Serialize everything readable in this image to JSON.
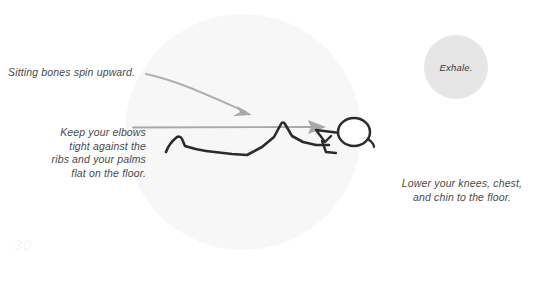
{
  "page": {
    "number": "30",
    "background_color": "#ffffff"
  },
  "pose_area": {
    "name": "pose-background-circle",
    "fill_color": "#f7f7f7"
  },
  "breath_cue": {
    "label": "Exhale.",
    "fill_color": "#e6e6e6",
    "text_color": "#3a3a3a"
  },
  "annotations": {
    "top": {
      "text": "Sitting bones spin upward.",
      "color": "#4a4a4a"
    },
    "left": {
      "lines": [
        "Keep your elbows",
        "tight against the",
        "ribs and your palms",
        "flat on the floor."
      ],
      "color": "#4a4a4a"
    },
    "right": {
      "lines": [
        "Lower your knees, chest,",
        "and chin to the floor."
      ],
      "color": "#4a4a4a"
    }
  },
  "arrows": {
    "spin_upward_arrow": {
      "name": "curved-arrow-to-hips",
      "color": "#a8a8a8"
    },
    "lower_body_arrow": {
      "name": "straight-arrow-to-head",
      "color": "#a8a8a8"
    }
  },
  "figure": {
    "name": "stick-figure-knees-chest-chin-pose",
    "stroke_color": "#2b2b2b"
  }
}
